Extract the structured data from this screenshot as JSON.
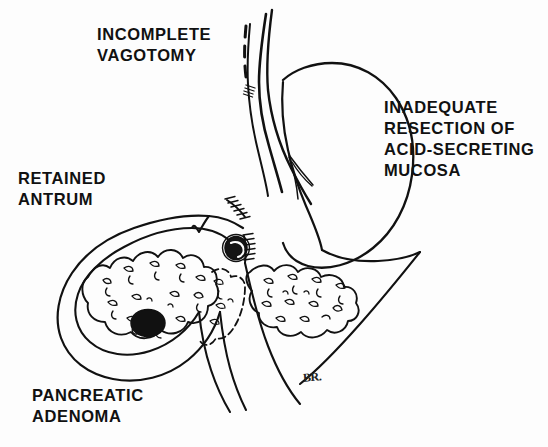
{
  "figure": {
    "kind": "medical-line-drawing",
    "background_color": "#fdfdfd",
    "ink_color": "#111111",
    "width": 548,
    "height": 447
  },
  "labels": {
    "incomplete_vagotomy": "INCOMPLETE\nVAGOTOMY",
    "inadequate_resection": "INADEQUATE\nRESECTION OF\nACID-SECRETING\nMUCOSA",
    "retained_antrum": "RETAINED\nANTRUM",
    "pancreatic_adenoma": "PANCREATIC\nADENOMA"
  },
  "signature": {
    "artist_monogram": "BR."
  },
  "anatomy": {
    "parts": [
      "esophagus",
      "vagus-nerve-trunk",
      "cut-vagal-fiber",
      "gastric-remnant",
      "lesser-curvature",
      "gastrojejunal-anastomosis",
      "marginal-ulcer",
      "duodenal-stump",
      "retained-antrum-loop",
      "pancreas-head",
      "pancreas-body-tail",
      "pancreatic-adenoma-nodule",
      "jejunal-afferent-limb",
      "jejunal-efferent-limb"
    ]
  }
}
